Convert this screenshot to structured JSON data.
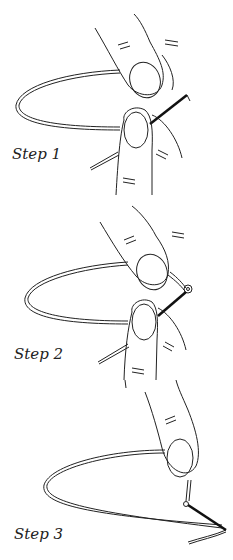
{
  "steps": [
    {
      "label": "Step 1",
      "description": "Thread loop held between thumb and finger, needle passes through"
    },
    {
      "label": "Step 2",
      "description": "Needle pulled through, forming a small knot at the tip"
    },
    {
      "label": "Step 3",
      "description": "Finger pulls the thread tight, knot secured at the end"
    }
  ],
  "colors": {
    "line": "#222222",
    "needle": "#111111",
    "background": "#ffffff"
  }
}
